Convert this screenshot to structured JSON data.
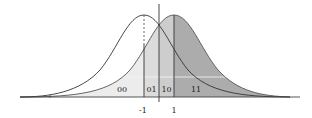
{
  "figure": {
    "region_labels": [
      "00",
      "01",
      "10",
      "11"
    ],
    "axis_ticks": [
      "-1",
      "1"
    ],
    "colors": {
      "light_fill": "#e6e6e6",
      "mid_fill": "#cfcfcf",
      "dark_fill": "#a9a9a9",
      "stroke": "#333333"
    }
  }
}
